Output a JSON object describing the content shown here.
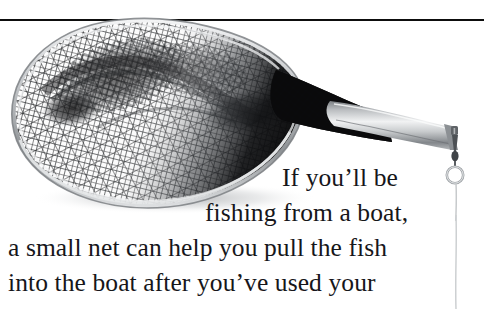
{
  "page": {
    "background_color": "#ffffff",
    "rule_color": "#0d0d0d"
  },
  "figure": {
    "caption_alt": "landing-net-photograph",
    "parts": [
      {
        "name": "net-hoop-rim",
        "color": "#b9bcbf"
      },
      {
        "name": "net-mesh-webbing",
        "color": "#1c1c1c"
      },
      {
        "name": "net-handle",
        "color": "#9ea2a6"
      },
      {
        "name": "swivel-snap-clip",
        "color": "#6e7276"
      },
      {
        "name": "lanyard-ring",
        "color": "#a9adb1"
      },
      {
        "name": "lanyard-cord",
        "color": "#c4c7ca"
      }
    ]
  },
  "body_text": {
    "line_1": "If you’ll be",
    "line_2": "fishing from a boat,",
    "line_3": "a small net can help you pull the fish",
    "line_4": "into the boat after you’ve used your"
  }
}
